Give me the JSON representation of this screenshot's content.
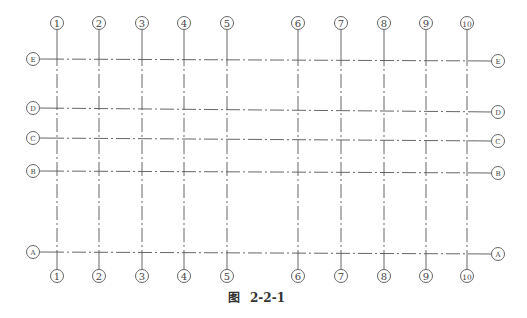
{
  "diagram": {
    "type": "structural axis grid",
    "line_color": "#555555",
    "columns": [
      {
        "label": "1",
        "glyph": "①",
        "x": 57
      },
      {
        "label": "2",
        "glyph": "②",
        "x": 99
      },
      {
        "label": "3",
        "glyph": "③",
        "x": 142
      },
      {
        "label": "4",
        "glyph": "④",
        "x": 184
      },
      {
        "label": "5",
        "glyph": "⑤",
        "x": 227
      },
      {
        "label": "6",
        "glyph": "⑥",
        "x": 298
      },
      {
        "label": "7",
        "glyph": "⑦",
        "x": 341
      },
      {
        "label": "8",
        "glyph": "⑧",
        "x": 384
      },
      {
        "label": "9",
        "glyph": "⑨",
        "x": 426
      },
      {
        "label": "10",
        "glyph": "⑩",
        "x": 467
      }
    ],
    "rows": [
      {
        "label": "E",
        "glyph": "Ⓔ",
        "y_left": 59,
        "y_right": 61
      },
      {
        "label": "D",
        "glyph": "Ⓓ",
        "y_left": 108,
        "y_right": 112
      },
      {
        "label": "C",
        "glyph": "Ⓒ",
        "y_left": 138,
        "y_right": 141
      },
      {
        "label": "B",
        "glyph": "Ⓑ",
        "y_left": 171,
        "y_right": 173
      },
      {
        "label": "A",
        "glyph": "Ⓐ",
        "y_left": 252,
        "y_right": 254
      }
    ]
  },
  "caption": {
    "prefix": "图",
    "number": "2-2-1"
  }
}
